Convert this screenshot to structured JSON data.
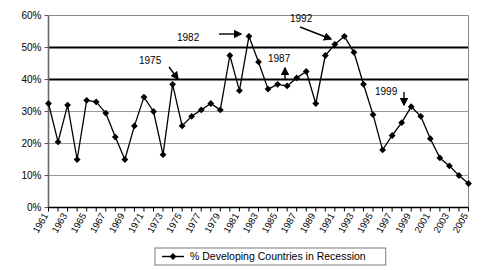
{
  "chart_data": {
    "type": "line",
    "title": "",
    "xlabel": "",
    "ylabel": "",
    "ylim": [
      0,
      60
    ],
    "xlim": [
      1961,
      2005
    ],
    "grid": true,
    "legend_position": "bottom",
    "y_ticks": [
      "0%",
      "10%",
      "20%",
      "30%",
      "40%",
      "50%",
      "60%"
    ],
    "y_tick_values": [
      0,
      10,
      20,
      30,
      40,
      50,
      60
    ],
    "x_tick_labels": [
      "1961",
      "1963",
      "1965",
      "1967",
      "1969",
      "1971",
      "1973",
      "1975",
      "1977",
      "1979",
      "1981",
      "1983",
      "1985",
      "1987",
      "1989",
      "1991",
      "1993",
      "1995",
      "1997",
      "1999",
      "2001",
      "2003",
      "2005"
    ],
    "series": [
      {
        "name": "% Developing Countries in Recession",
        "marker": "diamond",
        "color": "#000000",
        "x": [
          1961,
          1962,
          1963,
          1964,
          1965,
          1966,
          1967,
          1968,
          1969,
          1970,
          1971,
          1972,
          1973,
          1974,
          1975,
          1976,
          1977,
          1978,
          1979,
          1980,
          1981,
          1982,
          1983,
          1984,
          1985,
          1986,
          1987,
          1988,
          1989,
          1990,
          1991,
          1992,
          1993,
          1994,
          1995,
          1996,
          1997,
          1998,
          1999,
          2000,
          2001,
          2002,
          2003,
          2004,
          2005
        ],
        "values": [
          32.5,
          20.5,
          32.0,
          15.0,
          33.5,
          33.0,
          29.5,
          22.0,
          15.0,
          25.5,
          34.5,
          30.0,
          16.5,
          38.5,
          25.5,
          28.5,
          30.5,
          32.5,
          30.5,
          47.5,
          36.5,
          53.5,
          45.5,
          37.0,
          38.5,
          38.0,
          40.5,
          42.5,
          32.5,
          47.5,
          51.0,
          53.5,
          48.5,
          38.5,
          29.0,
          18.0,
          22.5,
          26.5,
          31.5,
          28.5,
          21.5,
          15.5,
          13.0,
          10.0,
          7.5
        ]
      }
    ],
    "annotations": [
      {
        "label": "1975",
        "text_x": 139,
        "text_y": 64,
        "arrow_from_x": 169,
        "arrow_from_y": 67,
        "arrow_to_x": 178,
        "arrow_to_y": 79
      },
      {
        "label": "1982",
        "text_x": 177,
        "text_y": 41,
        "arrow_from_x": 219,
        "arrow_from_y": 34,
        "arrow_to_x": 241,
        "arrow_to_y": 34
      },
      {
        "label": "1987",
        "text_x": 268,
        "text_y": 62,
        "arrow_from_x": 285,
        "arrow_from_y": 80,
        "arrow_to_x": 285,
        "arrow_to_y": 68
      },
      {
        "label": "1992",
        "text_x": 290,
        "text_y": 22,
        "arrow_from_x": 300,
        "arrow_from_y": 27,
        "arrow_to_x": 331,
        "arrow_to_y": 39
      },
      {
        "label": "1999",
        "text_x": 375,
        "text_y": 95,
        "arrow_from_x": 404,
        "arrow_from_y": 92,
        "arrow_to_x": 404,
        "arrow_to_y": 105
      }
    ],
    "legend": {
      "entries": [
        {
          "label": "% Developing Countries in Recession",
          "color": "#000000",
          "marker": "diamond"
        }
      ]
    }
  }
}
